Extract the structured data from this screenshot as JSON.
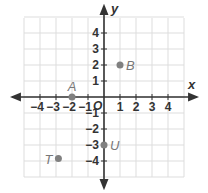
{
  "chart_data": {
    "type": "scatter",
    "title": "",
    "xlabel": "x",
    "ylabel": "y",
    "origin_label": "O",
    "xlim": [
      -5,
      5
    ],
    "ylim": [
      -5,
      5
    ],
    "grid": true,
    "x_ticks": [
      -4,
      -3,
      -2,
      -1,
      1,
      2,
      3,
      4
    ],
    "y_ticks": [
      4,
      3,
      2,
      1,
      -1,
      -2,
      -3,
      -4
    ],
    "x_tick_labels": [
      "−4",
      "−3",
      "−2",
      "−1",
      "1",
      "2",
      "3",
      "4"
    ],
    "y_tick_labels": [
      "4",
      "3",
      "2",
      "1",
      "−1",
      "−2",
      "−3",
      "−4"
    ],
    "points": [
      {
        "label": "A",
        "x": -2,
        "y": 0,
        "label_pos": "above"
      },
      {
        "label": "B",
        "x": 1,
        "y": 2,
        "label_pos": "right"
      },
      {
        "label": "U",
        "x": 0,
        "y": -3,
        "label_pos": "right"
      },
      {
        "label": "T",
        "x": -2.85,
        "y": -3.85,
        "label_pos": "left"
      }
    ],
    "colors": {
      "grid": "#dddddd",
      "axis": "#333333",
      "point": "#808080",
      "point_label": "#777777"
    }
  }
}
